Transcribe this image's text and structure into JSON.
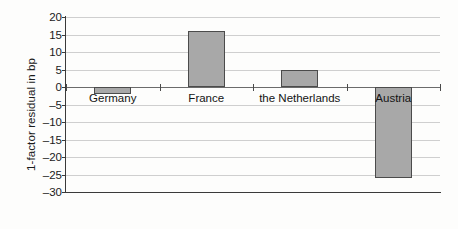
{
  "chart_data": {
    "type": "bar",
    "title": "",
    "subtitle": "",
    "xlabel": "",
    "ylabel": "1-factor residual in bp",
    "categories": [
      "Germany",
      "France",
      "the Netherlands",
      "Austria"
    ],
    "values": [
      -2,
      16,
      5,
      -26
    ],
    "series": [
      {
        "name": "1-factor residual",
        "values": [
          -2,
          16,
          5,
          -26
        ]
      }
    ],
    "ylim": [
      -30,
      20
    ],
    "yticks": [
      20,
      15,
      10,
      5,
      0,
      -5,
      -10,
      -15,
      -20,
      -25,
      -30
    ],
    "ytick_labels": [
      "20",
      "15",
      "10",
      "5",
      "0",
      "-5",
      "-10",
      "-15",
      "-20",
      "-25",
      "-30"
    ],
    "grid": true,
    "grid_axis": "y",
    "legend": false,
    "legend_position": "none",
    "bar_fill_color": "#a8a8a8",
    "bar_edge_color": "#4b4b4b",
    "grid_color": "#cfcfcf",
    "axis_color": "#3a3a3a",
    "zero_line_color": "#6b6b6b",
    "background_color": "#fdfdfc",
    "text_color": "#141414"
  }
}
